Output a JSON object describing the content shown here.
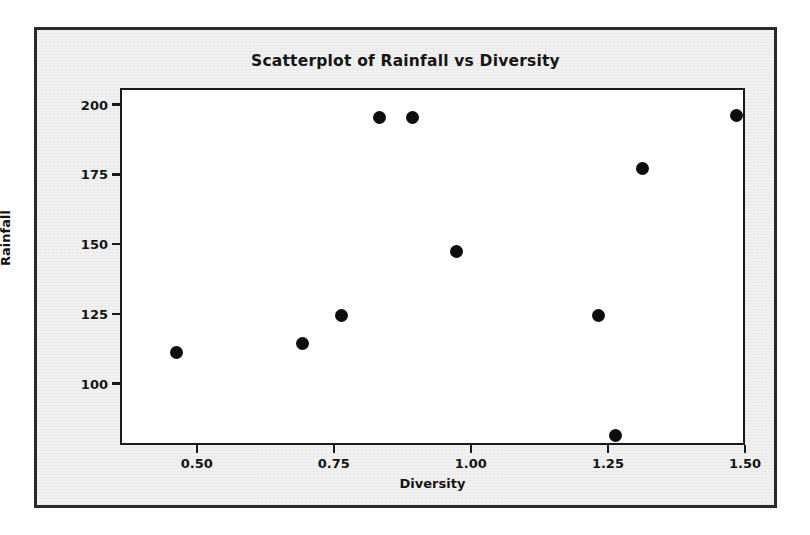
{
  "chart_data": {
    "type": "scatter",
    "title": "Scatterplot of Rainfall vs Diversity",
    "xlabel": "Diversity",
    "ylabel": "Rainfall",
    "xlim": [
      0.36,
      1.5
    ],
    "ylim": [
      78,
      206
    ],
    "xticks": [
      "0.50",
      "0.75",
      "1.00",
      "1.25",
      "1.50"
    ],
    "xtick_values": [
      0.5,
      0.75,
      1.0,
      1.25,
      1.5
    ],
    "yticks": [
      "100",
      "125",
      "150",
      "175",
      "200"
    ],
    "ytick_values": [
      100,
      125,
      150,
      175,
      200
    ],
    "grid": false,
    "legend": null,
    "marker": "filled-circle",
    "marker_color": "#0d0d0d",
    "x": [
      0.46,
      0.69,
      0.76,
      0.83,
      0.89,
      0.97,
      1.23,
      1.26,
      1.31,
      1.48
    ],
    "y": [
      112,
      115,
      125,
      196,
      196,
      148,
      125,
      82,
      178,
      197
    ],
    "points": [
      {
        "x": 0.46,
        "y": 112
      },
      {
        "x": 0.69,
        "y": 115
      },
      {
        "x": 0.76,
        "y": 125
      },
      {
        "x": 0.83,
        "y": 196
      },
      {
        "x": 0.89,
        "y": 196
      },
      {
        "x": 0.97,
        "y": 148
      },
      {
        "x": 1.23,
        "y": 125
      },
      {
        "x": 1.26,
        "y": 82
      },
      {
        "x": 1.31,
        "y": 178
      },
      {
        "x": 1.48,
        "y": 197
      }
    ]
  },
  "style": {
    "page_background": "#ffffff",
    "figure_background": "#f2f2f2",
    "plot_background": "#ffffff",
    "frame_color": "#1a1a1a",
    "text_color": "#141414"
  }
}
